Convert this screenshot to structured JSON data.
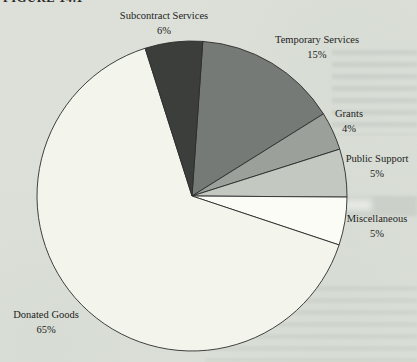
{
  "figure": {
    "label": "FIGURE 14.1"
  },
  "chart_data": {
    "type": "pie",
    "title": "FIGURE 14.1",
    "legend": "none",
    "direction": "clockwise",
    "start_angle_deg": 4,
    "center": {
      "x": 192,
      "y": 196
    },
    "radius": 155,
    "outline_color": "#2d2d2d",
    "text_color": "#1c1c1c",
    "background_color": "#dce0d8",
    "slices": [
      {
        "label": "Temporary Services",
        "value": 15,
        "pct_label": "15%",
        "color": "#767a76"
      },
      {
        "label": "Grants",
        "value": 4,
        "pct_label": "4%",
        "color": "#9ba09b"
      },
      {
        "label": "Public Support",
        "value": 5,
        "pct_label": "5%",
        "color": "#c3c8c1"
      },
      {
        "label": "Miscellaneous",
        "value": 5,
        "pct_label": "5%",
        "color": "#fbfcf6"
      },
      {
        "label": "Donated Goods",
        "value": 65,
        "pct_label": "65%",
        "color": "#f3f4ec"
      },
      {
        "label": "Subcontract Services",
        "value": 6,
        "pct_label": "6%",
        "color": "#3b3e3b"
      }
    ]
  }
}
